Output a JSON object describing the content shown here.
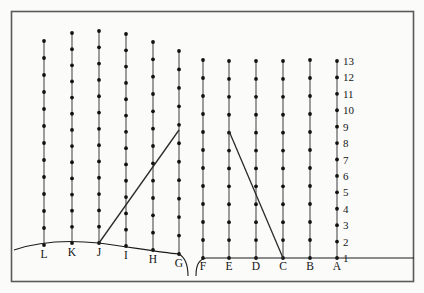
{
  "figure": {
    "title": "",
    "background_color": "#fbfbfa",
    "frame_color": "#5a5a5a",
    "line_color": "#4d4d4d",
    "dot_color": "#111111",
    "ground_color": "#1c1c1c",
    "ray_color": "#2a2a2a"
  },
  "chart_data": {
    "type": "scatter",
    "title": "",
    "xlabel": "",
    "ylabel": "",
    "grid": false,
    "legend": "none",
    "y_axis": {
      "tick_labels": [
        "1",
        "2",
        "3",
        "4",
        "5",
        "6",
        "7",
        "8",
        "9",
        "10",
        "11",
        "12",
        "13"
      ],
      "values": [
        1,
        2,
        3,
        4,
        5,
        6,
        7,
        8,
        9,
        10,
        11,
        12,
        13
      ],
      "position": "right",
      "attached_to_column": "A",
      "ylim": [
        1,
        13
      ]
    },
    "x_axis": {
      "tick_labels": [
        "L",
        "K",
        "J",
        "I",
        "H",
        "G",
        "F",
        "E",
        "D",
        "C",
        "B",
        "A"
      ],
      "position": "bottom"
    },
    "categories": [
      "L",
      "K",
      "J",
      "I",
      "H",
      "G",
      "F",
      "E",
      "D",
      "C",
      "B",
      "A"
    ],
    "series": [
      {
        "name": "column dot count",
        "values": [
          13,
          14,
          14,
          14,
          13,
          12,
          12,
          12,
          12,
          12,
          12,
          13
        ]
      }
    ],
    "columns": [
      {
        "label": "L",
        "x_px": 44,
        "top_px": 41,
        "bottom_px": 245,
        "dots": 13
      },
      {
        "label": "K",
        "x_px": 72,
        "top_px": 33,
        "bottom_px": 243,
        "dots": 14
      },
      {
        "label": "J",
        "x_px": 99,
        "top_px": 31,
        "bottom_px": 243,
        "dots": 14
      },
      {
        "label": "I",
        "x_px": 126,
        "top_px": 34,
        "bottom_px": 246,
        "dots": 14
      },
      {
        "label": "H",
        "x_px": 153,
        "top_px": 42,
        "bottom_px": 250,
        "dots": 13
      },
      {
        "label": "G",
        "x_px": 179,
        "top_px": 51,
        "bottom_px": 254,
        "dots": 12
      },
      {
        "label": "F",
        "x_px": 203,
        "top_px": 60,
        "bottom_px": 258,
        "dots": 12
      },
      {
        "label": "E",
        "x_px": 229,
        "top_px": 61,
        "bottom_px": 258,
        "dots": 12
      },
      {
        "label": "D",
        "x_px": 256,
        "top_px": 61,
        "bottom_px": 258,
        "dots": 12
      },
      {
        "label": "C",
        "x_px": 283,
        "top_px": 61,
        "bottom_px": 258,
        "dots": 12
      },
      {
        "label": "B",
        "x_px": 310,
        "top_px": 60,
        "bottom_px": 258,
        "dots": 12
      },
      {
        "label": "A",
        "x_px": 337,
        "top_px": 61,
        "bottom_px": 258,
        "dots": 13
      }
    ],
    "annotations": [
      {
        "name": "ascending-ray",
        "from_label": "J",
        "from_level": 1,
        "to_label": "G",
        "to_level": 9,
        "from_px": [
          99,
          243
        ],
        "to_px": [
          179,
          130
        ]
      },
      {
        "name": "descending-ray",
        "from_label": "E",
        "from_level": 9,
        "to_label": "C",
        "to_level": 1,
        "from_px": [
          229,
          131
        ],
        "to_px": [
          283,
          258
        ]
      }
    ],
    "ground_profile": {
      "name": "terrain-outline",
      "description": "left hill crest near J with slope down to G, break/gap between G and F, flat ground from F rightward",
      "left_segment_px": "M 14,250 C 34,243 60,239 99,243 C 130,247 158,252 179,254",
      "gap_segment_px": "M 179,254 C 186,258 188,266 188,276",
      "right_start_px": "M 196,276 C 196,266 198,260 206,258 L 414,258"
    }
  },
  "labels": {
    "y_ticks": [
      "13",
      "12",
      "11",
      "10",
      "9",
      "8",
      "7",
      "6",
      "5",
      "4",
      "3",
      "2",
      "1"
    ],
    "stations_left": [
      "L",
      "K",
      "J",
      "I",
      "H",
      "G"
    ],
    "stations_right": [
      "F",
      "E",
      "D",
      "C",
      "B",
      "A"
    ]
  }
}
